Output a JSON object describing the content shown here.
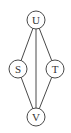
{
  "diagram": {
    "type": "graph",
    "nodes": [
      {
        "id": "U",
        "label": "U",
        "cx": 36,
        "cy": 20,
        "r": 9
      },
      {
        "id": "S",
        "label": "S",
        "cx": 18,
        "cy": 69,
        "r": 9
      },
      {
        "id": "T",
        "label": "T",
        "cx": 55,
        "cy": 69,
        "r": 9
      },
      {
        "id": "V",
        "label": "V",
        "cx": 36,
        "cy": 117,
        "r": 9
      }
    ],
    "edges": [
      {
        "from": "U",
        "to": "S"
      },
      {
        "from": "U",
        "to": "V"
      },
      {
        "from": "U",
        "to": "T"
      },
      {
        "from": "S",
        "to": "V"
      },
      {
        "from": "T",
        "to": "V"
      }
    ]
  }
}
